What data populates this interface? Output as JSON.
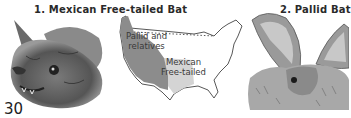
{
  "page_number": "30",
  "species": [
    {
      "number": "1.",
      "name": "Mexican Free-tailed Bat"
    },
    {
      "number": "2.",
      "name": "Pallid Bat"
    }
  ],
  "range_map": {
    "regions": [
      {
        "label_line1": "Pallid and",
        "label_line2": "relatives",
        "color": "#8c8c8c"
      },
      {
        "label_line1": "Mexican",
        "label_line2": "Free-tailed",
        "color": "#d4d4d4"
      }
    ]
  }
}
